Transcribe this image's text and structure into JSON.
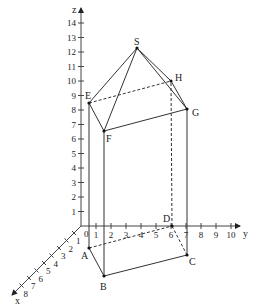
{
  "diagram": {
    "type": "3d-coordinate-solid",
    "axes": {
      "x": {
        "label": "x",
        "ticks": [
          "1",
          "2",
          "3",
          "4",
          "5",
          "6",
          "7",
          "8"
        ]
      },
      "y": {
        "label": "y",
        "ticks": [
          "1",
          "2",
          "3",
          "4",
          "5",
          "6",
          "7",
          "8",
          "9",
          "10"
        ]
      },
      "z": {
        "label": "z",
        "ticks": [
          "1",
          "2",
          "3",
          "4",
          "5",
          "6",
          "7",
          "8",
          "9",
          "10",
          "11",
          "12",
          "13",
          "14"
        ]
      },
      "origin_label": "0"
    },
    "points": {
      "A": "A",
      "B": "B",
      "C": "C",
      "D": "D",
      "E": "E",
      "F": "F",
      "G": "G",
      "H": "H",
      "S": "S"
    },
    "edges_solid": [
      "AB",
      "BC",
      "BF",
      "CG",
      "EF",
      "FG",
      "GH",
      "ES",
      "FS",
      "GS",
      "HS",
      "AE"
    ],
    "edges_dashed": [
      "AD",
      "DC",
      "DH",
      "EH"
    ]
  }
}
